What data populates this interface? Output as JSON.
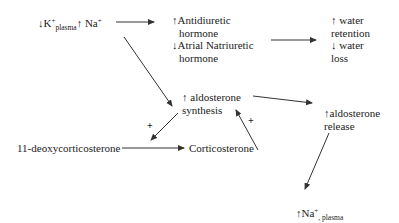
{
  "diagram": {
    "nodes": {
      "stimulus": {
        "k_arrow": "↓",
        "k_label": "K",
        "k_charge": "+",
        "k_sub": "plasma",
        "na_arrow": "↑",
        "na_label": " Na",
        "na_charge": "+"
      },
      "hormones": {
        "adh_arrow": "↑",
        "adh_line1": "Antidiuretic",
        "adh_line2": "hormone",
        "anh_arrow": "↓",
        "anh_line1": "Atrial Natriuretic",
        "anh_line2": "hormone"
      },
      "water": {
        "ret_arrow": "↑",
        "ret_line1": " water",
        "ret_line2": "retention",
        "loss_arrow": "↓",
        "loss_line1": " water",
        "loss_line2": "loss"
      },
      "aldo_synthesis": {
        "arrow": "↑",
        "line1": " aldosterone",
        "line2": "synthesis"
      },
      "aldo_release": {
        "arrow": "↑",
        "line1": "aldosterone",
        "line2": "release"
      },
      "deoxy": {
        "label": "11-deoxycorticosterone"
      },
      "cortico": {
        "label": "Corticosterone"
      },
      "na_plasma": {
        "arrow": "↑",
        "label": "Na",
        "charge": "+",
        "sub": ", plasma"
      }
    },
    "plus_signs": [
      "+",
      "+"
    ],
    "line_color": "#333333"
  }
}
